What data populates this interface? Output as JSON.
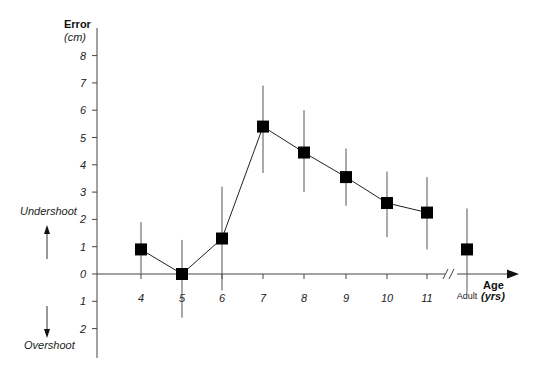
{
  "chart_data": {
    "type": "line",
    "title": "",
    "xlabel": "Age",
    "xlabel_unit": "(yrs)",
    "ylabel": "Error",
    "ylabel_unit": "(cm)",
    "categories": [
      "4",
      "5",
      "6",
      "7",
      "8",
      "9",
      "10",
      "11",
      "Adult"
    ],
    "series": [
      {
        "name": "Mean error",
        "values": [
          0.9,
          0.0,
          1.3,
          5.4,
          4.45,
          3.55,
          2.6,
          2.25,
          0.9
        ],
        "error_low": [
          0.0,
          -1.6,
          -0.6,
          3.7,
          3.0,
          2.5,
          1.35,
          0.9,
          -0.65
        ],
        "error_high": [
          1.9,
          1.25,
          3.2,
          6.9,
          6.0,
          4.6,
          3.75,
          3.55,
          2.4
        ],
        "connected": [
          true,
          true,
          true,
          true,
          true,
          true,
          true,
          true,
          false
        ],
        "marker": "square",
        "color": "#000000"
      }
    ],
    "y_ticks": [
      {
        "value": 8,
        "label": "8"
      },
      {
        "value": 7,
        "label": "7"
      },
      {
        "value": 6,
        "label": "6"
      },
      {
        "value": 5,
        "label": "5"
      },
      {
        "value": 4,
        "label": "4"
      },
      {
        "value": 3,
        "label": "3"
      },
      {
        "value": 2,
        "label": "2"
      },
      {
        "value": 1,
        "label": "1"
      },
      {
        "value": 0,
        "label": "0"
      },
      {
        "value": -1,
        "label": "1"
      },
      {
        "value": -2,
        "label": "2"
      }
    ],
    "ylim": [
      -3,
      9
    ],
    "grid": false,
    "axis_break": "between 11 and Adult",
    "annotations": [
      {
        "text": "Undershoot",
        "direction": "up"
      },
      {
        "text": "Overshoot",
        "direction": "down"
      }
    ]
  },
  "labels": {
    "y_title": "Error",
    "y_unit": "(cm)",
    "x_title": "Age",
    "x_unit": "(yrs)",
    "undershoot": "Undershoot",
    "overshoot": "Overshoot"
  }
}
